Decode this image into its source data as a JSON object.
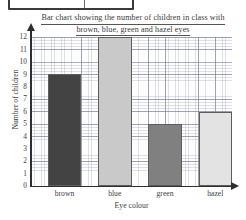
{
  "top_fragment": {
    "note": "partial-box",
    "text": ""
  },
  "chart_data": {
    "type": "bar",
    "title_line1": "Bar chart showing the number of children in class with",
    "title_line2": "brown, blue, green and hazel eyes",
    "title": "Bar chart showing the number of children in class with brown, blue, green and hazel eyes",
    "categories": [
      "brown",
      "blue",
      "green",
      "hazel"
    ],
    "values": [
      9,
      12,
      5,
      6
    ],
    "bar_colors": [
      "#434343",
      "#c9c9c9",
      "#808080",
      "#e3e3e3"
    ],
    "bar_border_color": "#5d5d5d",
    "xlabel": "Eye colour",
    "ylabel": "Number of children",
    "ylim": [
      0,
      12
    ],
    "ytick_labels": [
      "12",
      "11",
      "10",
      "9",
      "8",
      "7",
      "6",
      "5",
      "4",
      "3",
      "2",
      "1",
      "0"
    ],
    "grid": true,
    "grid_style": "graph-paper",
    "legend": "none"
  }
}
